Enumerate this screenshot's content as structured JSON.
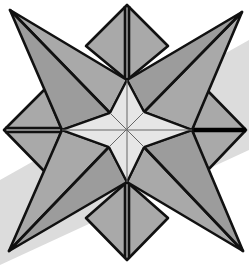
{
  "figure": {
    "alt": "Line drawing of a folded origami star with four long diagonal points, four shorter square points and a light four-pointed star in the center",
    "colors": {
      "background": "#ffffff",
      "band": "#dcdcdc",
      "fold_fill": "#a9a9a9",
      "inner_fill": "#e6e6e6",
      "outline": "#111111"
    }
  }
}
